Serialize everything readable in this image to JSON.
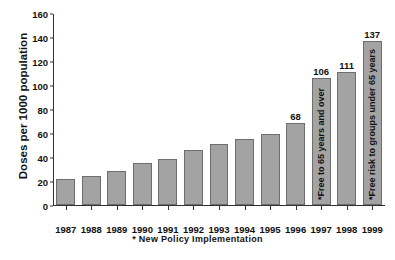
{
  "chart_data": {
    "type": "bar",
    "title": "",
    "xlabel": "",
    "ylabel": "Doses per 1000 population",
    "footnote": "* New Policy  Implementation",
    "categories": [
      "1987",
      "1988",
      "1989",
      "1990",
      "1991",
      "1992",
      "1993",
      "1994",
      "1995",
      "1996",
      "1997",
      "1998",
      "1999"
    ],
    "values": [
      22,
      24,
      28,
      35,
      38,
      46,
      51,
      55,
      59,
      68,
      106,
      111,
      137
    ],
    "value_labels": [
      "",
      "",
      "",
      "",
      "",
      "",
      "",
      "",
      "",
      "68",
      "106",
      "111",
      "137"
    ],
    "bar_notes": [
      "",
      "",
      "",
      "",
      "",
      "",
      "",
      "",
      "",
      "",
      "*Free to 65 years and over",
      "",
      "*Free risk to groups under 65 years"
    ],
    "ylim": [
      0,
      160
    ],
    "yticks": [
      0,
      20,
      40,
      60,
      80,
      100,
      120,
      140,
      160
    ],
    "ytick_labels": [
      "0",
      "20",
      "40",
      "60",
      "80",
      "100",
      "120",
      "140",
      "160"
    ],
    "grid": false,
    "legend": false,
    "bar_color": "#a3a3a3",
    "bar_border_color": "#6e6e6e",
    "axis_color": "#333333",
    "text_color": "#111111",
    "background": "#ffffff"
  }
}
